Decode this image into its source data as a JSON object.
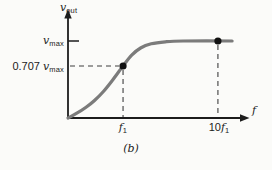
{
  "figure": {
    "caption": "(b)",
    "background": "#fbfbf9"
  },
  "labels": {
    "y_axis": {
      "var": "v",
      "sub": "out"
    },
    "y_tick_vmax": {
      "num": "",
      "var": "v",
      "sub": "max"
    },
    "y_tick_0707": {
      "num": "0.707 ",
      "var": "v",
      "sub": "max"
    },
    "x_tick_f1": {
      "num": "",
      "var": "f",
      "sub": "1"
    },
    "x_tick_10f1": {
      "num": "10",
      "var": "f",
      "sub": "1"
    },
    "x_axis": {
      "var": "f"
    }
  },
  "colors": {
    "axis": "#1c1c1c",
    "curve": "#7b7b7b",
    "dot": "#111111",
    "dashed": "#3f3f3f"
  },
  "chart_data": {
    "type": "line",
    "title": "",
    "xlabel": "f",
    "ylabel": "v_out",
    "x_ticks": [
      "f1",
      "10f1"
    ],
    "y_ticks": [
      "v_max",
      "0.707 v_max"
    ],
    "axis_ranges": {
      "x": [
        "0",
        "beyond 10f1"
      ],
      "y": [
        "0",
        "v_max"
      ]
    },
    "grid": false,
    "points": [
      {
        "label": "f1",
        "value": "0.707 v_max",
        "x_frac": 0.311,
        "y_frac": 0.52,
        "guides": [
          "h",
          "v"
        ]
      },
      {
        "label": "10f1",
        "value": "v_max",
        "x_frac": 0.847,
        "y_frac": 0.77,
        "guides": [
          "v"
        ]
      }
    ],
    "y_levels": [
      {
        "label": "v_max",
        "y_frac": 0.77,
        "tick": true
      },
      {
        "label": "0.707 v_max",
        "y_frac": 0.52,
        "tick": false
      }
    ],
    "curve_samples": [
      [
        0.0,
        0.0
      ],
      [
        0.05,
        0.048
      ],
      [
        0.1,
        0.105
      ],
      [
        0.15,
        0.175
      ],
      [
        0.2,
        0.265
      ],
      [
        0.25,
        0.375
      ],
      [
        0.311,
        0.52
      ],
      [
        0.36,
        0.628
      ],
      [
        0.41,
        0.7
      ],
      [
        0.47,
        0.742
      ],
      [
        0.55,
        0.762
      ],
      [
        0.65,
        0.77
      ],
      [
        0.927,
        0.77
      ]
    ]
  }
}
